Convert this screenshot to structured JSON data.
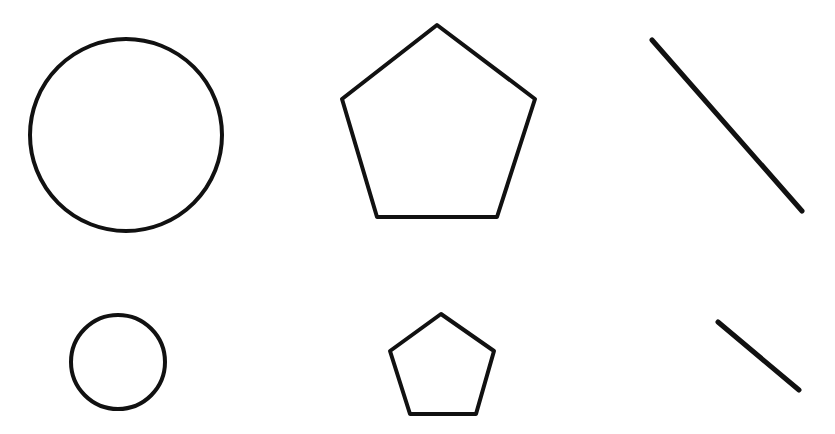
{
  "canvas": {
    "width": 835,
    "height": 434,
    "background": "#ffffff",
    "stroke": "#111111"
  },
  "shapes": {
    "large": {
      "circle": {
        "cx": 126,
        "cy": 135,
        "r": 96,
        "stroke_width": 4
      },
      "pentagon": {
        "points": "437,25 535,99 497,217 377,217 342,99",
        "stroke_width": 4
      },
      "line": {
        "x1": 652,
        "y1": 40,
        "x2": 802,
        "y2": 211,
        "stroke_width": 5
      }
    },
    "small": {
      "circle": {
        "cx": 118,
        "cy": 362,
        "r": 47,
        "stroke_width": 4
      },
      "pentagon": {
        "points": "441,314 494,351 476,414 410,414 390,351",
        "stroke_width": 4
      },
      "line": {
        "x1": 718,
        "y1": 322,
        "x2": 799,
        "y2": 390,
        "stroke_width": 5
      }
    }
  }
}
